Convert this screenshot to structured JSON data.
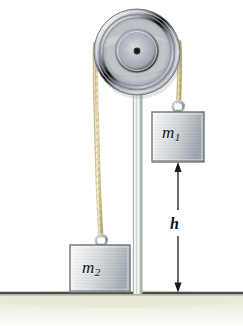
{
  "figure": {
    "width": 243,
    "height": 326,
    "background_color": "#ffffff"
  },
  "labels": {
    "m1": {
      "base": "m",
      "subscript": "1"
    },
    "m2": {
      "base": "m",
      "subscript": "2"
    },
    "height": "h"
  },
  "colors": {
    "pulley_rim_light": "#e3e6e8",
    "pulley_rim_dark": "#767d85",
    "pulley_face": "#b9bfc4",
    "pulley_hub": "#151515",
    "rope": "#e3d6a6",
    "rope_shadow": "#b9a872",
    "block_face_light": "#f2f3f4",
    "block_face_dark": "#9aa0a4",
    "block_edge": "#6f7478",
    "pole_glass": "#cfdcd2",
    "pole_edge": "#8ba394",
    "ground_line": "#4a4a44",
    "ground_shadow": "#efeedf",
    "arrow": "#1b1b1b",
    "ring_metal": "#c8ccd0"
  },
  "elements": {
    "pulley": {
      "cx": 137,
      "cy": 52,
      "r": 43
    },
    "support_pole": {
      "x": 133,
      "top": 88,
      "bottom": 293,
      "width": 9
    },
    "block_m1": {
      "x": 152,
      "y": 112,
      "w": 52,
      "h": 50
    },
    "block_m2": {
      "x": 70,
      "y": 245,
      "w": 60,
      "h": 47
    },
    "ground_line_y": 293,
    "height_arrow": {
      "x": 178,
      "top": 163,
      "bottom": 292
    },
    "rope_left": {
      "from_x": 96,
      "from_y": 48,
      "to_x": 100,
      "to_y": 236
    },
    "rope_right": {
      "from_x": 179,
      "from_y": 48,
      "to_x": 178,
      "to_y": 104
    }
  }
}
